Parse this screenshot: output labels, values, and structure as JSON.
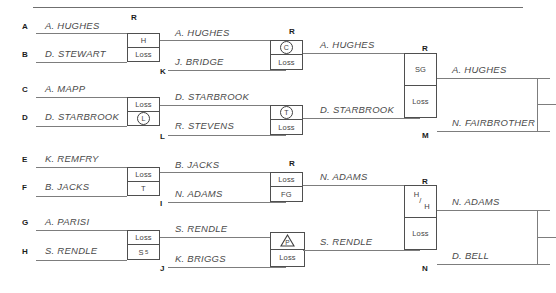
{
  "diagram": {
    "type": "single-elimination-tournament-bracket",
    "round_header_label": "R",
    "loss_label": "Loss"
  },
  "seeds": [
    {
      "id": "A",
      "x": 22,
      "y": 23
    },
    {
      "id": "B",
      "x": 22,
      "y": 51
    },
    {
      "id": "C",
      "x": 22,
      "y": 86
    },
    {
      "id": "D",
      "x": 22,
      "y": 114
    },
    {
      "id": "E",
      "x": 22,
      "y": 156
    },
    {
      "id": "F",
      "x": 22,
      "y": 184
    },
    {
      "id": "G",
      "x": 22,
      "y": 219
    },
    {
      "id": "H",
      "x": 22,
      "y": 248
    },
    {
      "id": "I",
      "x": 160,
      "y": 200
    },
    {
      "id": "J",
      "x": 160,
      "y": 265
    },
    {
      "id": "K",
      "x": 160,
      "y": 68
    },
    {
      "id": "L",
      "x": 160,
      "y": 133
    },
    {
      "id": "M",
      "x": 422,
      "y": 132
    },
    {
      "id": "N",
      "x": 422,
      "y": 265
    }
  ],
  "round_headers": [
    {
      "x": 131,
      "y": 14
    },
    {
      "x": 289,
      "y": 28
    },
    {
      "x": 289,
      "y": 160
    },
    {
      "x": 422,
      "y": 45
    },
    {
      "x": 422,
      "y": 178
    }
  ],
  "round1": [
    {
      "name": "match-A-B",
      "top_player": "A. HUGHES",
      "bottom_player": "D. STEWART",
      "top_result": "H",
      "bottom_result": "Loss",
      "top_result_kind": "text",
      "bottom_result_kind": "text"
    },
    {
      "name": "match-C-D",
      "top_player": "A. MAPP",
      "bottom_player": "D. STARBROOK",
      "top_result": "Loss",
      "bottom_result": "L",
      "top_result_kind": "text",
      "bottom_result_kind": "circle"
    },
    {
      "name": "match-E-F",
      "top_player": "K. REMFRY",
      "bottom_player": "B. JACKS",
      "top_result": "Loss",
      "bottom_result": "T",
      "top_result_kind": "text",
      "bottom_result_kind": "text"
    },
    {
      "name": "match-G-H",
      "top_player": "A. PARISI",
      "bottom_player": "S. RENDLE",
      "top_result": "Loss",
      "bottom_result": "S",
      "bottom_result_sub": "5",
      "top_result_kind": "text",
      "bottom_result_kind": "text-sub"
    }
  ],
  "round2": [
    {
      "name": "match-K",
      "top_player": "A. HUGHES",
      "bottom_player": "J. BRIDGE",
      "top_result": "C",
      "bottom_result": "Loss",
      "top_result_kind": "circle",
      "bottom_result_kind": "text"
    },
    {
      "name": "match-L",
      "top_player": "D. STARBROOK",
      "bottom_player": "R. STEVENS",
      "top_result": "T",
      "bottom_result": "Loss",
      "top_result_kind": "circle",
      "bottom_result_kind": "text"
    },
    {
      "name": "match-I",
      "top_player": "B. JACKS",
      "bottom_player": "N. ADAMS",
      "top_result": "Loss",
      "bottom_result": "FG",
      "top_result_kind": "text",
      "bottom_result_kind": "text"
    },
    {
      "name": "match-J",
      "top_player": "S. RENDLE",
      "bottom_player": "K. BRIGGS",
      "top_result": "P",
      "bottom_result": "Loss",
      "top_result_kind": "triangle",
      "bottom_result_kind": "text"
    }
  ],
  "round3": [
    {
      "name": "match-M",
      "top_player": "A. HUGHES",
      "bottom_player": "D. STARBROOK",
      "top_result": "SG",
      "bottom_result": "Loss",
      "top_result_kind": "text",
      "bottom_result_kind": "text"
    },
    {
      "name": "match-N",
      "top_player": "N. ADAMS",
      "bottom_player": "S. RENDLE",
      "top_result_a": "H",
      "top_result_slash": "/",
      "top_result_b": "H",
      "bottom_result": "Loss",
      "top_result_kind": "stacked",
      "bottom_result_kind": "text"
    }
  ],
  "round4": [
    {
      "name": "finalist-top",
      "player": "A. HUGHES"
    },
    {
      "name": "finalist-second",
      "player": "N. FAIRBROTHER"
    },
    {
      "name": "finalist-third",
      "player": "N. ADAMS"
    },
    {
      "name": "finalist-fourth",
      "player": "D. BELL"
    }
  ]
}
